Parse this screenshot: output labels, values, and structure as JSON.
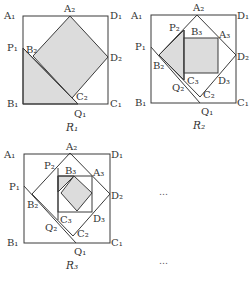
{
  "figures": [
    {
      "caption": "R₁",
      "labels": {
        "A1": "A₁",
        "A2": "A₂",
        "D1": "D₁",
        "D2": "D₂",
        "P1": "P₁",
        "B2": "B₂",
        "B1": "B₁",
        "C2": "C₂",
        "Q1": "Q₁",
        "C1": "C₁"
      }
    },
    {
      "caption": "R₂",
      "labels": {
        "A1": "A₁",
        "A2": "A₂",
        "D1": "D₁",
        "P2": "P₂",
        "B3": "B₃",
        "A3": "A₃",
        "P1": "P₁",
        "D2": "D₂",
        "B2": "B₂",
        "C3": "C₃",
        "D3": "D₃",
        "Q2": "Q₂",
        "C2": "C₂",
        "B1": "B₁",
        "C1": "C₁",
        "Q1": "Q₁"
      }
    },
    {
      "caption": "R₃",
      "labels": {
        "A1": "A₁",
        "A2": "A₂",
        "D1": "D₁",
        "P2": "P₂",
        "B3": "B₃",
        "A3": "A₃",
        "P1": "P₁",
        "D2": "D₂",
        "B2": "B₂",
        "C3": "C₃",
        "D3": "D₃",
        "Q2": "Q₂",
        "C2": "C₂",
        "B1": "B₁",
        "C1": "C₁",
        "Q1": "Q₁"
      }
    }
  ],
  "continuation": [
    "…",
    "…"
  ],
  "colors": {
    "shade": "#dcdcdc",
    "stroke": "#3a3a3a",
    "text": "#333333"
  }
}
